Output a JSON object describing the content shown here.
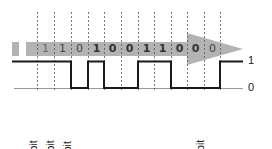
{
  "diagram": {
    "bits": [
      {
        "value": "1",
        "style": "faint"
      },
      {
        "value": "1",
        "style": "normal"
      },
      {
        "value": "0",
        "style": "normal"
      },
      {
        "value": "1",
        "style": "bold"
      },
      {
        "value": "0",
        "style": "bold"
      },
      {
        "value": "0",
        "style": "bold"
      },
      {
        "value": "1",
        "style": "bold"
      },
      {
        "value": "1",
        "style": "bold"
      },
      {
        "value": "0",
        "style": "bold"
      },
      {
        "value": "0",
        "style": "bold"
      },
      {
        "value": "0",
        "style": "normal"
      }
    ],
    "levels": {
      "high": "1",
      "low": "0"
    },
    "labels": [
      {
        "text": "Stop bit",
        "x": 44
      },
      {
        "text": "Stop bit",
        "x": 61
      },
      {
        "text": "Parity bit",
        "x": 78
      },
      {
        "text": "Start bit",
        "x": 211
      }
    ],
    "colors": {
      "arrow": "#b3b3b3",
      "waveform": "#1a1a1a",
      "baseline": "#999999",
      "gridline": "#555555"
    }
  }
}
